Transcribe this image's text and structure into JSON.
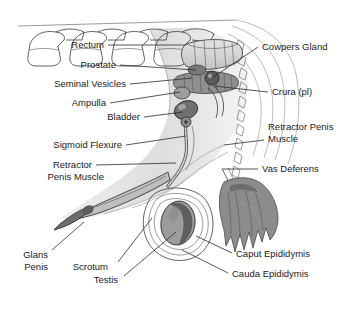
{
  "figure": {
    "background_color": "#ffffff",
    "line_color": "#3a3a3a",
    "label_color": "#1a1a1a"
  },
  "labels_left": [
    {
      "text": "Rectum",
      "x": 104,
      "y": 48,
      "line": "M108,45 L186,45"
    },
    {
      "text": "Prostate",
      "x": 116,
      "y": 68,
      "line": "M120,65 L196,70"
    },
    {
      "text": "Seminal Vesicles",
      "x": 126,
      "y": 87,
      "line": "M130,84 L192,78"
    },
    {
      "text": "Ampulla",
      "x": 106,
      "y": 106,
      "line": "M110,103 L180,92"
    },
    {
      "text": "Bladder",
      "x": 140,
      "y": 120,
      "line": "M144,117 L183,112"
    },
    {
      "text": "Sigmoid Flexure",
      "x": 122,
      "y": 148,
      "line": "M126,145 L186,136"
    },
    {
      "text": "Retractor",
      "x": 92,
      "y": 168,
      "line": "M96,165 L176,163"
    },
    {
      "text": "Penis Muscle",
      "x": 104,
      "y": 180,
      "line": ""
    },
    {
      "text": "Glans",
      "x": 48,
      "y": 258,
      "line": "M52,250 L84,222"
    },
    {
      "text": "Penis",
      "x": 48,
      "y": 270,
      "line": ""
    },
    {
      "text": "Scrotum",
      "x": 108,
      "y": 270,
      "line": "M118,262 L152,218"
    },
    {
      "text": "Testis",
      "x": 118,
      "y": 283,
      "line": "M124,276 L176,232"
    }
  ],
  "labels_right": [
    {
      "text": "Cowpers Gland",
      "x": 262,
      "y": 50,
      "line": "M258,47 L212,78"
    },
    {
      "text": "Crura (pl)",
      "x": 272,
      "y": 95,
      "line": "M268,92 L214,86"
    },
    {
      "text": "Retractor Penis",
      "x": 268,
      "y": 130,
      "line": "M264,140 L224,145"
    },
    {
      "text": "Muscle",
      "x": 268,
      "y": 142,
      "line": ""
    },
    {
      "text": "Vas Deferens",
      "x": 262,
      "y": 172,
      "line": "M258,169 L222,169"
    },
    {
      "text": "Caput Epididymis",
      "x": 236,
      "y": 257,
      "line": "M232,253 L196,236"
    },
    {
      "text": "Cauda Epididymis",
      "x": 232,
      "y": 277,
      "line": "M228,273 L182,250"
    }
  ],
  "structures": [
    {
      "name": "lumbar-vertebrae",
      "tone": "#ffffff"
    },
    {
      "name": "rectum",
      "tone": "#d8d8d8"
    },
    {
      "name": "prostate",
      "tone": "#8a8a8a"
    },
    {
      "name": "seminal-vesicles",
      "tone": "#8a8a8a"
    },
    {
      "name": "ampulla",
      "tone": "#9a9a9a"
    },
    {
      "name": "bladder",
      "tone": "#707070"
    },
    {
      "name": "sigmoid-flexure",
      "tone": "#c8c8c8"
    },
    {
      "name": "penis-shaft",
      "tone": "#bdbdbd"
    },
    {
      "name": "glans-penis",
      "tone": "#6e6e6e"
    },
    {
      "name": "testis",
      "tone": "#9b9b9b"
    },
    {
      "name": "epididymis-body",
      "tone": "#5f5f5f"
    },
    {
      "name": "caput-cauda-epididymis",
      "tone": "#8c8c8c"
    },
    {
      "name": "tail-vertebrae",
      "tone": "#ffffff"
    },
    {
      "name": "body-contour",
      "tone": "#bcbcbc"
    }
  ]
}
